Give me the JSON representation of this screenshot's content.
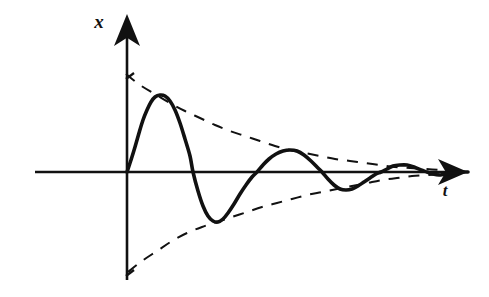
{
  "figure": {
    "background_color": "#ffffff",
    "ink_color": "#111111"
  },
  "axes": {
    "vertical": {
      "label": "x",
      "label_position": {
        "x": 99,
        "y": 28
      },
      "arrow": true,
      "origin_x": 127,
      "top_y": 14,
      "bottom_y": 280
    },
    "horizontal": {
      "label": "t",
      "label_position": {
        "x": 445,
        "y": 196
      },
      "arrow": true,
      "origin_y": 172,
      "left_x": 35,
      "right_x": 468
    },
    "ticks": [
      {
        "name": "upper-envelope-tick",
        "x": 127,
        "y": 75
      },
      {
        "name": "lower-envelope-tick",
        "x": 127,
        "y": 272
      }
    ]
  },
  "chart_data": {
    "type": "line",
    "title": "",
    "xlabel": "t",
    "ylabel": "x",
    "grid": false,
    "legend": null,
    "axis_origin": {
      "x": 127,
      "y": 172
    },
    "series": [
      {
        "name": "damped-oscillation",
        "style": "solid",
        "stroke_width": 3.6,
        "color": "#111111",
        "points": [
          [
            127,
            172
          ],
          [
            131,
            160
          ],
          [
            135,
            147
          ],
          [
            139,
            133
          ],
          [
            143,
            120
          ],
          [
            147,
            110
          ],
          [
            151,
            102
          ],
          [
            155,
            97
          ],
          [
            160,
            95
          ],
          [
            165,
            96
          ],
          [
            170,
            101
          ],
          [
            175,
            110
          ],
          [
            180,
            123
          ],
          [
            185,
            139
          ],
          [
            190,
            156
          ],
          [
            193,
            172
          ],
          [
            198,
            191
          ],
          [
            203,
            206
          ],
          [
            208,
            216
          ],
          [
            213,
            221
          ],
          [
            218,
            222
          ],
          [
            223,
            219
          ],
          [
            228,
            213
          ],
          [
            234,
            204
          ],
          [
            240,
            194
          ],
          [
            246,
            185
          ],
          [
            252,
            177
          ],
          [
            257,
            172
          ],
          [
            263,
            165
          ],
          [
            269,
            159
          ],
          [
            276,
            154
          ],
          [
            283,
            151
          ],
          [
            290,
            150
          ],
          [
            297,
            151
          ],
          [
            304,
            155
          ],
          [
            311,
            161
          ],
          [
            318,
            168
          ],
          [
            322,
            172
          ],
          [
            328,
            179
          ],
          [
            334,
            185
          ],
          [
            340,
            189
          ],
          [
            346,
            190
          ],
          [
            352,
            189
          ],
          [
            358,
            186
          ],
          [
            364,
            182
          ],
          [
            370,
            178
          ],
          [
            376,
            174
          ],
          [
            381,
            172
          ],
          [
            387,
            169
          ],
          [
            393,
            166
          ],
          [
            400,
            165
          ],
          [
            407,
            165
          ],
          [
            414,
            167
          ],
          [
            421,
            170
          ],
          [
            427,
            172
          ],
          [
            433,
            174
          ],
          [
            439,
            175
          ],
          [
            445,
            174
          ],
          [
            452,
            173
          ],
          [
            460,
            172
          ],
          [
            468,
            172
          ]
        ]
      },
      {
        "name": "upper-envelope",
        "style": "dashed",
        "stroke_width": 2.0,
        "color": "#111111",
        "dash_pattern": "11 9",
        "points": [
          [
            126,
            74
          ],
          [
            140,
            85
          ],
          [
            155,
            94
          ],
          [
            170,
            103
          ],
          [
            185,
            111
          ],
          [
            200,
            118
          ],
          [
            215,
            125
          ],
          [
            230,
            131
          ],
          [
            245,
            136
          ],
          [
            260,
            141
          ],
          [
            275,
            146
          ],
          [
            290,
            150
          ],
          [
            305,
            153
          ],
          [
            320,
            156
          ],
          [
            335,
            159
          ],
          [
            350,
            161
          ],
          [
            365,
            163
          ],
          [
            380,
            165
          ],
          [
            395,
            167
          ],
          [
            410,
            168
          ],
          [
            425,
            169
          ],
          [
            440,
            170
          ],
          [
            455,
            171
          ],
          [
            468,
            172
          ]
        ]
      },
      {
        "name": "lower-envelope",
        "style": "dashed",
        "stroke_width": 2.0,
        "color": "#111111",
        "dash_pattern": "11 9",
        "points": [
          [
            128,
            272
          ],
          [
            142,
            261
          ],
          [
            157,
            251
          ],
          [
            172,
            241
          ],
          [
            187,
            233
          ],
          [
            202,
            227
          ],
          [
            217,
            222
          ],
          [
            232,
            217
          ],
          [
            247,
            212
          ],
          [
            262,
            207
          ],
          [
            277,
            203
          ],
          [
            292,
            199
          ],
          [
            307,
            195
          ],
          [
            322,
            192
          ],
          [
            337,
            189
          ],
          [
            352,
            186
          ],
          [
            367,
            183
          ],
          [
            382,
            180
          ],
          [
            397,
            178
          ],
          [
            412,
            176
          ],
          [
            427,
            175
          ],
          [
            442,
            174
          ],
          [
            455,
            173
          ],
          [
            468,
            172
          ]
        ]
      }
    ],
    "annotations": [
      {
        "name": "first-peak",
        "x": 160,
        "y": 95
      },
      {
        "name": "first-trough",
        "x": 217,
        "y": 222
      },
      {
        "name": "second-peak",
        "x": 290,
        "y": 150
      },
      {
        "name": "second-trough",
        "x": 346,
        "y": 190
      },
      {
        "name": "third-peak",
        "x": 404,
        "y": 165
      }
    ]
  }
}
